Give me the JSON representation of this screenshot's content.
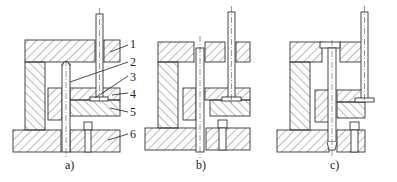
{
  "figure": {
    "panels": [
      {
        "id": "a",
        "caption": "a)"
      },
      {
        "id": "b",
        "caption": "b)"
      },
      {
        "id": "c",
        "caption": "c)"
      }
    ],
    "callouts": [
      {
        "number": "1"
      },
      {
        "number": "2"
      },
      {
        "number": "3"
      },
      {
        "number": "4"
      },
      {
        "number": "5"
      },
      {
        "number": "6"
      }
    ],
    "colors": {
      "line": "#333333",
      "hatch": "#555555",
      "background": "#ffffff"
    }
  }
}
